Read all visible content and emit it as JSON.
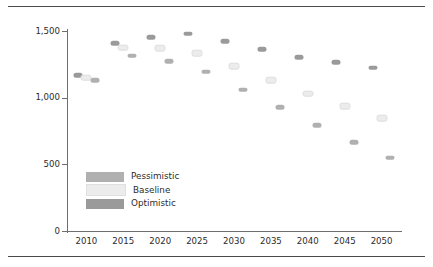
{
  "chart_data": {
    "type": "scatter",
    "title": "",
    "xlabel": "",
    "ylabel": "Thousands",
    "xlim": [
      2007.5,
      2052.5
    ],
    "ylim": [
      0,
      1500
    ],
    "grid": false,
    "legend_position": "inside-bottom-left",
    "y_ticks": [
      "0",
      "500",
      "1,000",
      "1,500"
    ],
    "y_tick_values": [
      0,
      500,
      1000,
      1500
    ],
    "x_ticks": [
      "2010",
      "2015",
      "2020",
      "2025",
      "2030",
      "2035",
      "2040",
      "2045",
      "2050"
    ],
    "x_tick_values": [
      2010,
      2015,
      2020,
      2025,
      2030,
      2035,
      2040,
      2045,
      2050
    ],
    "categories": [
      2010,
      2015,
      2020,
      2025,
      2030,
      2035,
      2040,
      2045,
      2050
    ],
    "series": [
      {
        "name": "Optimistic",
        "color": "#9a9a9a",
        "x_offset": -1.2,
        "values": [
          1170,
          1410,
          1455,
          1480,
          1425,
          1365,
          1305,
          1265,
          1225
        ]
      },
      {
        "name": "Baseline",
        "color": "#ececec",
        "x_offset": 0,
        "values": [
          1150,
          1375,
          1370,
          1335,
          1235,
          1130,
          1030,
          935,
          845
        ]
      },
      {
        "name": "Pessimistic",
        "color": "#b0b0b0",
        "x_offset": 1.2,
        "values": [
          1130,
          1315,
          1275,
          1195,
          1060,
          930,
          795,
          665,
          550
        ]
      }
    ]
  },
  "legend": {
    "items": [
      {
        "label": "Pessimistic",
        "color": "#b0b0b0"
      },
      {
        "label": "Baseline",
        "color": "#ececec"
      },
      {
        "label": "Optimistic",
        "color": "#9a9a9a"
      }
    ]
  },
  "axis": {
    "y_title": "Thousands"
  },
  "colors": {
    "axis": "#6e6e6e",
    "text": "#2b2b2b",
    "rule": "#4a4a4a",
    "background": "#ffffff"
  }
}
